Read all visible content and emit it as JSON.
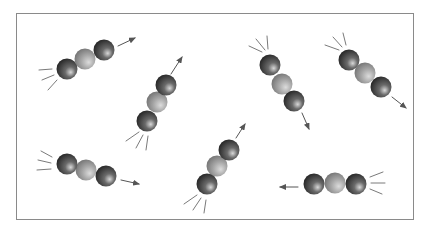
{
  "figure": {
    "frame": {
      "x": 16,
      "y": 13,
      "width": 399,
      "height": 208,
      "border_color": "#8a8a8a"
    },
    "colors": {
      "outer_atom_dark": "#1e1e1e",
      "outer_atom_mid": "#6a6a6a",
      "outer_atom_highlight": "#d8d8d8",
      "center_atom_dark": "#6e6e6e",
      "center_atom_mid": "#a8a8a8",
      "center_atom_highlight": "#dcdcdc",
      "arrow": "#555555",
      "motion_lines": "#7a7a7a"
    },
    "atom_radius": 10.5,
    "molecules": [
      {
        "id": "molecule-1",
        "atoms": [
          [
            67,
            69
          ],
          [
            85,
            59
          ],
          [
            104,
            50
          ]
        ],
        "arrow": [
          [
            118,
            46
          ],
          [
            135,
            38
          ]
        ],
        "motion_lines": [
          [
            [
              52,
              69
            ],
            [
              39,
              70
            ]
          ],
          [
            [
              54,
              75
            ],
            [
              42,
              80
            ]
          ],
          [
            [
              57,
              80
            ],
            [
              48,
              90
            ]
          ]
        ]
      },
      {
        "id": "molecule-2",
        "atoms": [
          [
            147,
            121
          ],
          [
            157,
            102
          ],
          [
            166,
            85
          ]
        ],
        "arrow": [
          [
            171,
            74
          ],
          [
            182,
            57
          ]
        ],
        "motion_lines": [
          [
            [
              139,
              132
            ],
            [
              126,
              141
            ]
          ],
          [
            [
              143,
              135
            ],
            [
              136,
              148
            ]
          ],
          [
            [
              148,
              136
            ],
            [
              146,
              150
            ]
          ]
        ]
      },
      {
        "id": "molecule-3",
        "atoms": [
          [
            270,
            65
          ],
          [
            282,
            84
          ],
          [
            294,
            101
          ]
        ],
        "arrow": [
          [
            302,
            113
          ],
          [
            309,
            129
          ]
        ],
        "motion_lines": [
          [
            [
              262,
              52
            ],
            [
              249,
              46
            ]
          ],
          [
            [
              265,
              50
            ],
            [
              256,
              39
            ]
          ],
          [
            [
              268,
              49
            ],
            [
              267,
              36
            ]
          ]
        ]
      },
      {
        "id": "molecule-4",
        "atoms": [
          [
            349,
            60
          ],
          [
            365,
            73
          ],
          [
            381,
            87
          ]
        ],
        "arrow": [
          [
            392,
            97
          ],
          [
            406,
            108
          ]
        ],
        "motion_lines": [
          [
            [
              339,
              50
            ],
            [
              325,
              45
            ]
          ],
          [
            [
              342,
              47
            ],
            [
              333,
              37
            ]
          ],
          [
            [
              346,
              45
            ],
            [
              343,
              33
            ]
          ]
        ]
      },
      {
        "id": "molecule-5",
        "atoms": [
          [
            67,
            164
          ],
          [
            86,
            170
          ],
          [
            106,
            176
          ]
        ],
        "arrow": [
          [
            121,
            180
          ],
          [
            139,
            184
          ]
        ],
        "motion_lines": [
          [
            [
              52,
              157
            ],
            [
              41,
              151
            ]
          ],
          [
            [
              51,
              163
            ],
            [
              38,
              160
            ]
          ],
          [
            [
              51,
              169
            ],
            [
              37,
              170
            ]
          ]
        ]
      },
      {
        "id": "molecule-6",
        "atoms": [
          [
            207,
            184
          ],
          [
            217,
            166
          ],
          [
            229,
            150
          ]
        ],
        "arrow": [
          [
            236,
            138
          ],
          [
            245,
            124
          ]
        ],
        "motion_lines": [
          [
            [
              197,
              195
            ],
            [
              184,
              204
            ]
          ],
          [
            [
              201,
              198
            ],
            [
              193,
              210
            ]
          ],
          [
            [
              206,
              200
            ],
            [
              204,
              213
            ]
          ]
        ]
      },
      {
        "id": "molecule-7",
        "atoms": [
          [
            314,
            184
          ],
          [
            335,
            183
          ],
          [
            356,
            184
          ]
        ],
        "arrow": [
          [
            298,
            187
          ],
          [
            280,
            187
          ]
        ],
        "motion_lines": [
          [
            [
              370,
              177
            ],
            [
              383,
              172
            ]
          ],
          [
            [
              371,
              183
            ],
            [
              385,
              183
            ]
          ],
          [
            [
              370,
              189
            ],
            [
              382,
              194
            ]
          ]
        ]
      }
    ]
  }
}
